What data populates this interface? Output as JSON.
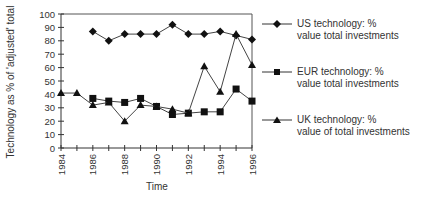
{
  "chart_data": {
    "type": "line",
    "title": "",
    "xlabel": "Time",
    "ylabel": "Technology as % of 'adjusted' total",
    "ylim": [
      0,
      100
    ],
    "yticks": [
      0,
      10,
      20,
      30,
      40,
      50,
      60,
      70,
      80,
      90,
      100
    ],
    "xlim": [
      1984,
      1996
    ],
    "xtick_labels": [
      "1984",
      "1986",
      "1988",
      "1990",
      "1992",
      "1994",
      "1996"
    ],
    "grid": false,
    "legend_position": "right",
    "series": [
      {
        "name": "US technology: % value total investments",
        "label_line1": "US technology: %",
        "label_line2": "value total investments",
        "marker": "diamond",
        "x": [
          1986,
          1987,
          1988,
          1989,
          1990,
          1991,
          1992,
          1993,
          1994,
          1995,
          1996
        ],
        "values": [
          87,
          80,
          85,
          85,
          85,
          92,
          85,
          85,
          87,
          84,
          81
        ]
      },
      {
        "name": "EUR technology: % value total investments",
        "label_line1": "EUR technology: %",
        "label_line2": "value total investments",
        "marker": "square",
        "x": [
          1986,
          1987,
          1988,
          1989,
          1990,
          1991,
          1992,
          1993,
          1994,
          1995,
          1996
        ],
        "values": [
          37,
          35,
          34,
          37,
          31,
          25,
          26,
          27,
          27,
          44,
          35
        ]
      },
      {
        "name": "UK technology: % value of total investments",
        "label_line1": "UK technology: %",
        "label_line2": "value of total investments",
        "marker": "triangle",
        "x": [
          1984,
          1985,
          1986,
          1987,
          1988,
          1989,
          1990,
          1991,
          1992,
          1993,
          1994,
          1995,
          1996
        ],
        "values": [
          41,
          41,
          32,
          34,
          20,
          32,
          31,
          29,
          26,
          61,
          42,
          85,
          62
        ]
      }
    ]
  }
}
